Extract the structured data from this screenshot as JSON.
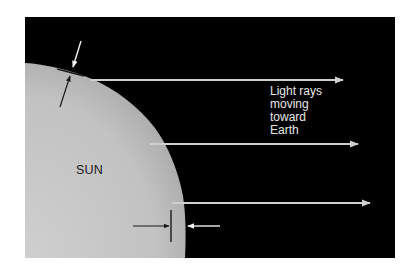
{
  "figure": {
    "background_color": "#000000",
    "sun_color": "#c4c4c4",
    "ray_color": "#cfcfcf",
    "marker_dark_color": "#1a1a1a",
    "marker_light_color": "#f0f0f0"
  },
  "labels": {
    "sun": "SUN",
    "rays": {
      "line1": "Light rays",
      "line2": "moving",
      "line3": "toward",
      "line4": "Earth"
    }
  },
  "rays": [
    {
      "name": "ray-top",
      "x1": 90,
      "y1": 80,
      "x2": 343
    },
    {
      "name": "ray-middle",
      "x1": 150,
      "y1": 144,
      "x2": 358
    },
    {
      "name": "ray-bottom",
      "x1": 172,
      "y1": 203,
      "x2": 370
    }
  ]
}
